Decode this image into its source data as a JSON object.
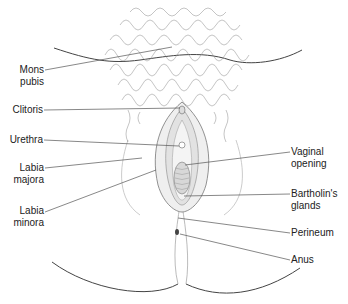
{
  "diagram": {
    "type": "anatomical-illustration",
    "labels_left": [
      {
        "id": "mons-pubis",
        "line1": "Mons",
        "line2": "pubis"
      },
      {
        "id": "clitoris",
        "line1": "Clitoris",
        "line2": ""
      },
      {
        "id": "urethra",
        "line1": "Urethra",
        "line2": ""
      },
      {
        "id": "labia-majora",
        "line1": "Labia",
        "line2": "majora"
      },
      {
        "id": "labia-minora",
        "line1": "Labia",
        "line2": "minora"
      }
    ],
    "labels_right": [
      {
        "id": "vaginal-opening",
        "line1": "Vaginal",
        "line2": "opening"
      },
      {
        "id": "bartholins-glands",
        "line1": "Bartholin's",
        "line2": "glands"
      },
      {
        "id": "perineum",
        "line1": "Perineum",
        "line2": ""
      },
      {
        "id": "anus",
        "line1": "Anus",
        "line2": ""
      }
    ],
    "colors": {
      "line": "#555555",
      "hair": "#8a8a8a",
      "text": "#222222",
      "shade": "#e4e4e4"
    }
  }
}
